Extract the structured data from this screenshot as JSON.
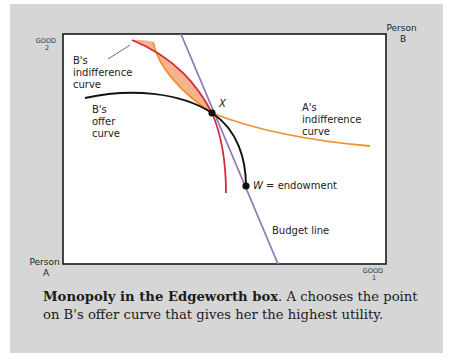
{
  "figure": {
    "corners": {
      "top_left_axis": {
        "line1": "GOOD",
        "line2": "2"
      },
      "top_right_person": {
        "line1": "Person",
        "line2": "B"
      },
      "bottom_left_person": {
        "line1": "Person",
        "line2": "A"
      },
      "bottom_right_axis": {
        "line1": "GOOD",
        "line2": "1"
      }
    },
    "labels": {
      "b_indifference": [
        "B's",
        "indifference",
        "curve"
      ],
      "b_offer": [
        "B's",
        "offer",
        "curve"
      ],
      "a_indifference": [
        "A's",
        "indifference",
        "curve"
      ],
      "point_x": "X",
      "endowment_var": "W",
      "endowment_text": " = endowment",
      "budget_line": "Budget line"
    },
    "colors": {
      "panel": "#d6d6d6",
      "box_border": "#1a1a1a",
      "b_indifference_curve": "#d42a3c",
      "a_indifference_curve": "#f0922e",
      "lens_fill": "#f4b48e",
      "offer_curve": "#111111",
      "budget_line": "#9478b8"
    }
  },
  "caption": {
    "bold": "Monopoly in the Edgeworth box",
    "text": ". A chooses the point on B's offer curve that gives her the highest utility."
  }
}
